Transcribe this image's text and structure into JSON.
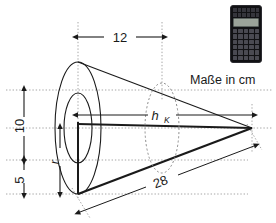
{
  "figure": {
    "note": "Maße in cm",
    "dimensions": {
      "top_length": "12",
      "height_upper": "10",
      "height_lower": "5",
      "slant_length": "28",
      "cone_height_symbol": "h",
      "cone_height_subscript": "K",
      "radius_symbol": "r"
    },
    "colors": {
      "outline": "#1a1a1a",
      "guide": "#9a9a9a",
      "dashed_ellipse": "#8c8c8c",
      "background": "#ffffff"
    }
  },
  "calculator": {
    "name": "Taschenrechner",
    "body_color": "#111114",
    "display_color": "#9ba39a",
    "key_color": "#4a4a52"
  }
}
